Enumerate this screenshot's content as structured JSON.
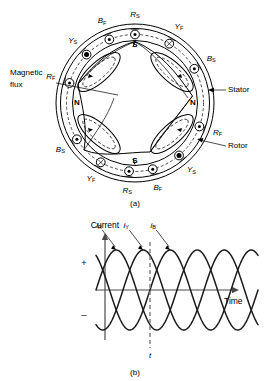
{
  "figure": {
    "panel_a": {
      "caption": "(a)",
      "callouts": [
        {
          "name": "magnetic-flux",
          "line1": "Magnetic",
          "line2": "flux"
        },
        {
          "name": "stator",
          "text": "Stator"
        },
        {
          "name": "rotor",
          "text": "Rotor"
        }
      ],
      "poles": [
        {
          "name": "pole-top",
          "text": "S",
          "angle_deg": 90
        },
        {
          "name": "pole-right",
          "text": "N",
          "angle_deg": 0
        },
        {
          "name": "pole-bottom",
          "text": "S",
          "angle_deg": 270
        },
        {
          "name": "pole-left",
          "text": "N",
          "angle_deg": 180
        }
      ],
      "slots": [
        {
          "name": "slot-r-s-top",
          "base": "R",
          "sub": "S",
          "angle_deg": 90,
          "marker": "dot-circle"
        },
        {
          "name": "slot-y-f-upper-r",
          "base": "Y",
          "sub": "F",
          "angle_deg": 60,
          "marker": "cross-circle"
        },
        {
          "name": "slot-b-s-right-u",
          "base": "B",
          "sub": "S",
          "angle_deg": 30,
          "marker": "dot-circle"
        },
        {
          "name": "slot-r-f-right",
          "base": "R",
          "sub": "F",
          "angle_deg": 340,
          "marker": "dot-circle"
        },
        {
          "name": "slot-y-s-lower-r",
          "base": "Y",
          "sub": "S",
          "angle_deg": 310,
          "marker": "solid-dot"
        },
        {
          "name": "slot-b-f-lower-r",
          "base": "B",
          "sub": "F",
          "angle_deg": 285,
          "marker": "dot-circle"
        },
        {
          "name": "slot-r-s-bottom",
          "base": "R",
          "sub": "S",
          "angle_deg": 265,
          "marker": "dot-circle"
        },
        {
          "name": "slot-y-f-lower-l",
          "base": "Y",
          "sub": "F",
          "angle_deg": 240,
          "marker": "cross-circle"
        },
        {
          "name": "slot-b-s-left-l",
          "base": "B",
          "sub": "S",
          "angle_deg": 212,
          "marker": "dot-circle"
        },
        {
          "name": "slot-r-f-left",
          "base": "R",
          "sub": "F",
          "angle_deg": 163,
          "marker": "dot-circle"
        },
        {
          "name": "slot-y-s-left-u",
          "base": "Y",
          "sub": "S",
          "angle_deg": 135,
          "marker": "solid-dot"
        },
        {
          "name": "slot-b-f-upper-l",
          "base": "B",
          "sub": "F",
          "angle_deg": 112,
          "marker": "dot-circle"
        }
      ]
    },
    "panel_b": {
      "caption": "(b)",
      "y_axis_label": "Current",
      "x_axis_label": "Time",
      "sign_positive": "+",
      "sign_negative": "–",
      "time_marker": "t",
      "curve_labels": [
        {
          "name": "curve-label-ir",
          "base": "i",
          "sub": "R"
        },
        {
          "name": "curve-label-iy",
          "base": "i",
          "sub": "Y"
        },
        {
          "name": "curve-label-ib",
          "base": "i",
          "sub": "B"
        }
      ]
    }
  },
  "chart_data": {
    "type": "line",
    "title": "",
    "xlabel": "Time",
    "ylabel": "Current",
    "x": [
      0,
      15,
      30,
      45,
      60,
      75,
      90,
      105,
      120,
      135,
      150,
      165,
      180,
      195,
      210,
      225,
      240,
      255,
      270,
      285,
      300,
      315,
      330,
      345,
      360,
      375,
      390,
      405,
      420,
      435,
      450,
      465,
      480,
      495,
      510,
      525,
      540,
      555,
      570,
      585,
      600,
      615,
      630,
      645,
      660,
      675,
      690,
      705,
      720
    ],
    "series": [
      {
        "name": "i_R",
        "phase_deg": 0,
        "amplitude": 1,
        "values": [
          0,
          0.259,
          0.5,
          0.707,
          0.866,
          0.966,
          1,
          0.966,
          0.866,
          0.707,
          0.5,
          0.259,
          0,
          -0.259,
          -0.5,
          -0.707,
          -0.866,
          -0.966,
          -1,
          -0.966,
          -0.866,
          -0.707,
          -0.5,
          -0.259,
          0,
          0.259,
          0.5,
          0.707,
          0.866,
          0.966,
          1,
          0.966,
          0.866,
          0.707,
          0.5,
          0.259,
          0,
          -0.259,
          -0.5,
          -0.707,
          -0.866,
          -0.966,
          -1,
          -0.966,
          -0.866,
          -0.707,
          -0.5,
          -0.259,
          0
        ]
      },
      {
        "name": "i_Y",
        "phase_deg": -120,
        "amplitude": 1,
        "values": [
          -0.866,
          -0.966,
          -1,
          -0.966,
          -0.866,
          -0.707,
          -0.5,
          -0.259,
          0,
          0.259,
          0.5,
          0.707,
          0.866,
          0.966,
          1,
          0.966,
          0.866,
          0.707,
          0.5,
          0.259,
          0,
          -0.259,
          -0.5,
          -0.707,
          -0.866,
          -0.966,
          -1,
          -0.966,
          -0.866,
          -0.707,
          -0.5,
          -0.259,
          0,
          0.259,
          0.5,
          0.707,
          0.866,
          0.966,
          1,
          0.966,
          0.866,
          0.707,
          0.5,
          0.259,
          0,
          -0.259,
          -0.5,
          -0.707,
          -0.866
        ]
      },
      {
        "name": "i_B",
        "phase_deg": -240,
        "amplitude": 1,
        "values": [
          0.866,
          0.707,
          0.5,
          0.259,
          0,
          -0.259,
          -0.5,
          -0.707,
          -0.866,
          -0.966,
          -1,
          -0.966,
          -0.866,
          -0.707,
          -0.5,
          -0.259,
          0,
          0.259,
          0.5,
          0.707,
          0.866,
          0.966,
          1,
          0.966,
          0.866,
          0.707,
          0.5,
          0.259,
          0,
          -0.259,
          -0.5,
          -0.707,
          -0.866,
          -0.966,
          -1,
          -0.966,
          -0.866,
          -0.707,
          -0.5,
          -0.259,
          0,
          0.259,
          0.5,
          0.707,
          0.866,
          0.966,
          1,
          0.966,
          0.866
        ]
      }
    ],
    "ylim": [
      -1.15,
      1.15
    ],
    "xlim": [
      0,
      720
    ],
    "grid": false,
    "legend": "inline-curve-labels",
    "annotations": [
      {
        "name": "time-instant",
        "label": "t",
        "x": 240,
        "type": "vertical-dashed-line"
      }
    ]
  }
}
